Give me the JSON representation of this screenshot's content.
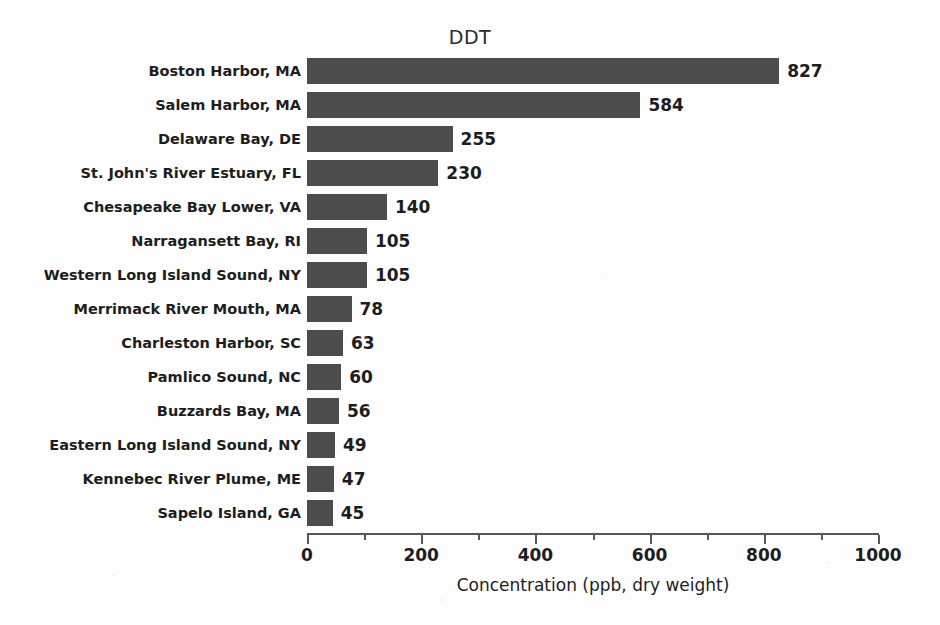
{
  "chart_data": {
    "type": "bar",
    "orientation": "horizontal",
    "title": "DDT",
    "xlabel": "Concentration (ppb, dry weight)",
    "ylabel": "",
    "xlim": [
      0,
      1000
    ],
    "xticks": [
      0,
      200,
      400,
      600,
      800,
      1000
    ],
    "xtick_labels": [
      "0",
      "200",
      "400",
      "600",
      "800",
      "1000"
    ],
    "minor_xticks": [
      100,
      300,
      500,
      700,
      900
    ],
    "grid": false,
    "legend": null,
    "bar_color": "#4c4c4c",
    "background_color": "#fdfdfd",
    "text_color": "#1d1d1d",
    "categories": [
      "Boston Harbor, MA",
      "Salem Harbor, MA",
      "Delaware Bay, DE",
      "St. John's River Estuary, FL",
      "Chesapeake Bay Lower, VA",
      "Narragansett Bay, RI",
      "Western Long Island Sound, NY",
      "Merrimack River Mouth, MA",
      "Charleston Harbor, SC",
      "Pamlico Sound, NC",
      "Buzzards Bay, MA",
      "Eastern Long Island Sound, NY",
      "Kennebec River Plume, ME",
      "Sapelo Island, GA"
    ],
    "values": [
      827,
      584,
      255,
      230,
      140,
      105,
      105,
      78,
      63,
      60,
      56,
      49,
      47,
      45
    ],
    "value_labels": [
      "827",
      "584",
      "255",
      "230",
      "140",
      "105",
      "105",
      "78",
      "63",
      "60",
      "56",
      "49",
      "47",
      "45"
    ]
  }
}
